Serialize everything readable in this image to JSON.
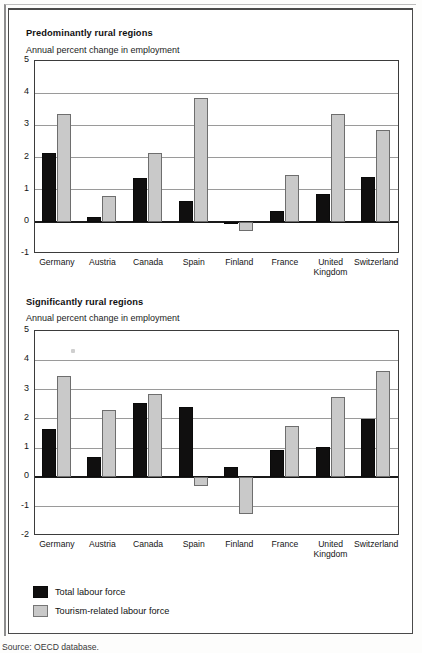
{
  "figure": {
    "source_note": "Source: OECD database.",
    "legend": {
      "items": [
        {
          "label": "Total labour force",
          "color": "#100f0f",
          "key": "total"
        },
        {
          "label": "Tourism-related labour force",
          "color": "#c9c9c9",
          "key": "tourism"
        }
      ]
    }
  },
  "chart_data": [
    {
      "type": "bar",
      "id": "predominantly-rural",
      "title": "Predominantly rural regions",
      "subtitle": "Annual percent change in employment",
      "xlabel": "",
      "ylabel": "Annual percent change in employment",
      "ylim": [
        -1,
        5
      ],
      "yticks": [
        5,
        4,
        3,
        2,
        1,
        0,
        -1
      ],
      "ytick_labels": [
        "5",
        "4",
        "3",
        "2",
        "1",
        "0",
        "-1"
      ],
      "grid": true,
      "legend_position": "below-figure",
      "categories": [
        "Germany",
        "Austria",
        "Canada",
        "Spain",
        "Finland",
        "France",
        "United Kingdom",
        "Switzerland"
      ],
      "series": [
        {
          "name": "Total labour force",
          "color": "#100f0f",
          "values": [
            2.15,
            0.15,
            1.35,
            0.65,
            -0.05,
            0.35,
            0.85,
            1.4
          ]
        },
        {
          "name": "Tourism-related labour force",
          "color": "#c9c9c9",
          "values": [
            3.35,
            0.8,
            2.15,
            3.85,
            -0.3,
            1.45,
            3.35,
            2.85
          ]
        }
      ]
    },
    {
      "type": "bar",
      "id": "significantly-rural",
      "title": "Significantly rural regions",
      "subtitle": "Annual percent change in employment",
      "xlabel": "",
      "ylabel": "Annual percent change in employment",
      "ylim": [
        -2,
        5
      ],
      "yticks": [
        5,
        4,
        3,
        2,
        1,
        0,
        -1,
        -2
      ],
      "ytick_labels": [
        "5",
        "4",
        "3",
        "2",
        "1",
        "0",
        "-1",
        "-2"
      ],
      "grid": true,
      "legend_position": "below-figure",
      "categories": [
        "Germany",
        "Austria",
        "Canada",
        "Spain",
        "Finland",
        "France",
        "United Kingdom",
        "Switzerland"
      ],
      "series": [
        {
          "name": "Total labour force",
          "color": "#100f0f",
          "values": [
            1.65,
            0.7,
            2.55,
            2.4,
            0.35,
            0.95,
            1.05,
            2.0
          ]
        },
        {
          "name": "Tourism-related labour force",
          "color": "#c9c9c9",
          "values": [
            3.45,
            2.3,
            2.85,
            -0.3,
            -1.25,
            1.75,
            2.75,
            3.65
          ]
        }
      ]
    }
  ]
}
